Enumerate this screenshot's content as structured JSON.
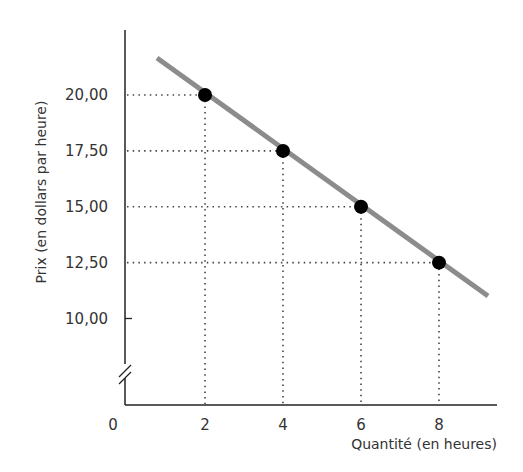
{
  "chart_data": {
    "type": "line",
    "title": "",
    "xlabel": "Quantité (en heures)",
    "ylabel": "Prix (en dollars par heure)",
    "x_origin_label": "0",
    "x_ticks": [
      "2",
      "4",
      "6",
      "8"
    ],
    "y_ticks": [
      "10,00",
      "12,50",
      "15,00",
      "17,50",
      "20,00"
    ],
    "series": [
      {
        "name": "Demand",
        "type": "line",
        "x": [
          2,
          4,
          6,
          8
        ],
        "y": [
          20.0,
          17.5,
          15.0,
          12.5
        ],
        "point_labels_x": [
          "2",
          "4",
          "6",
          "8"
        ],
        "point_labels_y": [
          "20,00",
          "17,50",
          "15,00",
          "12,50"
        ]
      }
    ],
    "xlim": [
      0,
      9.2
    ],
    "ylim": [
      7.5,
      22.5
    ],
    "y_axis_break": true,
    "grid": false,
    "guide_lines": "dotted",
    "legend": "none",
    "colors": {
      "line": "#8c8c8c",
      "points": "#000000",
      "axes": "#222222",
      "guides": "#444444"
    }
  }
}
